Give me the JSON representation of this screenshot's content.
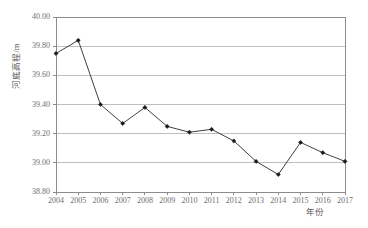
{
  "chart_data": {
    "type": "line",
    "title": "",
    "xlabel": "年份",
    "ylabel": "河底高程/m",
    "categories": [
      "2004",
      "2005",
      "2006",
      "2007",
      "2008",
      "2009",
      "2010",
      "2011",
      "2012",
      "2013",
      "2014",
      "2015",
      "2016",
      "2017"
    ],
    "values": [
      39.75,
      39.84,
      39.4,
      39.27,
      39.38,
      39.25,
      39.21,
      39.23,
      39.15,
      39.01,
      38.92,
      39.14,
      39.07,
      39.01
    ],
    "x": [
      2004,
      2005,
      2006,
      2007,
      2008,
      2009,
      2010,
      2011,
      2012,
      2013,
      2014,
      2015,
      2016,
      2017
    ],
    "xlim": [
      2004,
      2017
    ],
    "ylim": [
      38.8,
      40.0
    ],
    "yticks": [
      "40.00",
      "39.80",
      "39.60",
      "39.40",
      "39.20",
      "39.00",
      "38.80"
    ],
    "ytick_values": [
      40.0,
      39.8,
      39.6,
      39.4,
      39.2,
      39.0,
      38.8
    ],
    "grid": "horizontal",
    "legend": "none",
    "series": [
      {
        "name": "河底高程",
        "values": [
          39.75,
          39.84,
          39.4,
          39.27,
          39.38,
          39.25,
          39.21,
          39.23,
          39.15,
          39.01,
          38.92,
          39.14,
          39.07,
          39.01
        ],
        "line_color": "#404040",
        "marker": "diamond",
        "marker_color": "#1a1a1a"
      }
    ],
    "axis_color": "#8c8c8c",
    "grid_color": "#bfbfbf",
    "text_color": "#6e6e6e"
  }
}
